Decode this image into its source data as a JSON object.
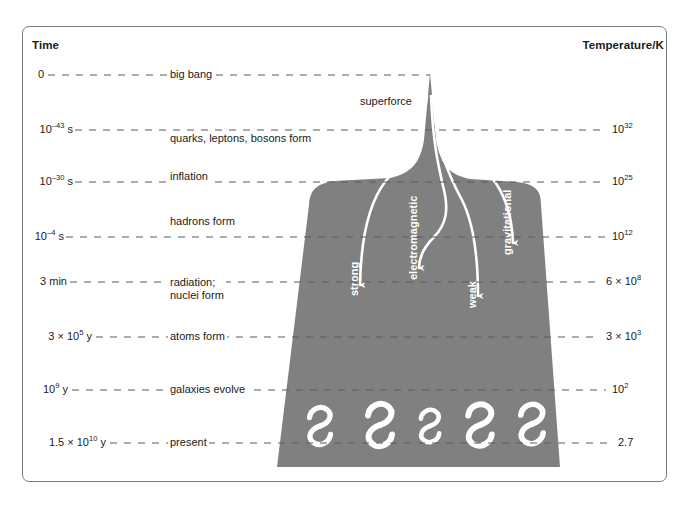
{
  "figure": {
    "time_axis_title": "Time",
    "temperature_axis_title": "Temperature/K",
    "superforce_label": "superforce",
    "gray_color": "#808080",
    "line_color": "#5a5a5a",
    "text_color": "#1a1a1a",
    "white": "#ffffff"
  },
  "chart_data": {
    "type": "diagram",
    "xlabel": "",
    "ylabel": "Time",
    "rows": [
      {
        "time": "0",
        "time_html": "0",
        "event": "big bang",
        "temperature": "",
        "temperature_html": ""
      },
      {
        "time": "10^-43 s",
        "time_html": "10<sup>–43</sup> s",
        "event": "quarks, leptons, bosons form",
        "temperature": "10^32",
        "temperature_html": "10<sup>32</sup>"
      },
      {
        "time": "10^-30 s",
        "time_html": "10<sup>–30</sup> s",
        "event": "inflation",
        "temperature": "10^25",
        "temperature_html": "10<sup>25</sup>"
      },
      {
        "time": "10^-4 s",
        "time_html": "10<sup>–4</sup> s",
        "event": "hadrons form",
        "temperature": "10^12",
        "temperature_html": "10<sup>12</sup>"
      },
      {
        "time": "3 min",
        "time_html": "3 min",
        "event": "radiation; nuclei form",
        "temperature": "6 x 10^8",
        "temperature_html": "6 × 10<sup>8</sup>"
      },
      {
        "time": "3 x 10^5 y",
        "time_html": "3 × 10<sup>5</sup> y",
        "event": "atoms form",
        "temperature": "3 x 10^3",
        "temperature_html": "3 × 10<sup>3</sup>"
      },
      {
        "time": "10^9 y",
        "time_html": "10<sup>9</sup> y",
        "event": "galaxies evolve",
        "temperature": "10^2",
        "temperature_html": "10<sup>2</sup>"
      },
      {
        "time": "1.5 x 10^10 y",
        "time_html": "1.5 × 10<sup>10</sup> y",
        "event": "present",
        "temperature": "2.7",
        "temperature_html": "2.7"
      }
    ],
    "forces": [
      {
        "name": "strong",
        "label": "strong"
      },
      {
        "name": "electromagnetic",
        "label": "electromagnetic"
      },
      {
        "name": "weak",
        "label": "weak"
      },
      {
        "name": "gravitational",
        "label": "gravitational"
      }
    ],
    "galaxy_count": 5,
    "legend": "",
    "grid": "dashed horizontal timeline rules"
  }
}
